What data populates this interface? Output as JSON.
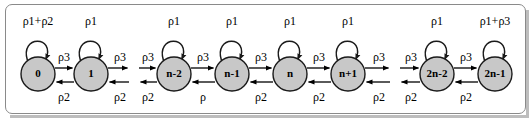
{
  "figure": {
    "width": 532,
    "height": 121,
    "background_color": "#ffffff",
    "frame_border_color": "#8a8a8a",
    "node_fill_color": "#c8c8c8",
    "node_stroke_color": "#1a1a1a",
    "arrow_color": "#000000"
  },
  "chart_data": {
    "type": "diagram",
    "diagram_kind": "markov-chain-state-transition",
    "node_radius": 17,
    "node_center_y": 74,
    "nodes": [
      {
        "id": "s0",
        "label": "0",
        "cx": 38,
        "cy": 74,
        "self_loop_rate": "ρ1+ρ2"
      },
      {
        "id": "s1",
        "label": "1",
        "cx": 91,
        "cy": 74,
        "self_loop_rate": "ρ1"
      },
      {
        "id": "sn-2",
        "label": "n-2",
        "cx": 174,
        "cy": 74,
        "self_loop_rate": "ρ1"
      },
      {
        "id": "sn-1",
        "label": "n-1",
        "cx": 232,
        "cy": 74,
        "self_loop_rate": "ρ1"
      },
      {
        "id": "sn",
        "label": "n",
        "cx": 290,
        "cy": 74,
        "self_loop_rate": "ρ1"
      },
      {
        "id": "sn+1",
        "label": "n+1",
        "cx": 348,
        "cy": 74,
        "self_loop_rate": "ρ1"
      },
      {
        "id": "s2n-2",
        "label": "2n-2",
        "cx": 437,
        "cy": 74,
        "self_loop_rate": "ρ1"
      },
      {
        "id": "s2n-1",
        "label": "2n-1",
        "cx": 495,
        "cy": 74,
        "self_loop_rate": "ρ1+ρ3"
      }
    ],
    "forward_transitions": [
      {
        "from": "s0",
        "to": "s1",
        "rate": "ρ3",
        "label_x": 64,
        "label_y": 58,
        "x1": 55,
        "x2": 74,
        "truncated": false
      },
      {
        "from": "s1",
        "to": "next",
        "rate": "ρ3",
        "label_x": 120,
        "label_y": 58,
        "x1": 108,
        "x2": 129,
        "truncated": true
      },
      {
        "from": "prev",
        "to": "sn-2",
        "rate": "ρ3",
        "label_x": 148,
        "label_y": 58,
        "x1": 139,
        "x2": 157,
        "truncated": true
      },
      {
        "from": "sn-2",
        "to": "sn-1",
        "rate": "ρ3",
        "label_x": 203,
        "label_y": 58,
        "x1": 191,
        "x2": 215,
        "truncated": false
      },
      {
        "from": "sn-1",
        "to": "sn",
        "rate": "ρ3",
        "label_x": 261,
        "label_y": 58,
        "x1": 249,
        "x2": 273,
        "truncated": false
      },
      {
        "from": "sn",
        "to": "sn+1",
        "rate": "ρ3",
        "label_x": 319,
        "label_y": 58,
        "x1": 307,
        "x2": 331,
        "truncated": false
      },
      {
        "from": "sn+1",
        "to": "next2",
        "rate": "ρ3",
        "label_x": 379,
        "label_y": 58,
        "x1": 365,
        "x2": 390,
        "truncated": true
      },
      {
        "from": "prev2",
        "to": "s2n-2",
        "rate": "ρ3",
        "label_x": 411,
        "label_y": 58,
        "x1": 400,
        "x2": 420,
        "truncated": true
      },
      {
        "from": "s2n-2",
        "to": "s2n-1",
        "rate": "ρ3",
        "label_x": 466,
        "label_y": 58,
        "x1": 454,
        "x2": 478,
        "truncated": false
      }
    ],
    "backward_transitions": [
      {
        "from": "s1",
        "to": "s0",
        "rate": "ρ2",
        "label_x": 64,
        "label_y": 98,
        "x1": 74,
        "x2": 55,
        "truncated": false
      },
      {
        "from": "next",
        "to": "s1",
        "rate": "ρ2",
        "label_x": 120,
        "label_y": 98,
        "x1": 129,
        "x2": 108,
        "truncated": true
      },
      {
        "from": "sn-2",
        "to": "prev",
        "rate": "ρ2",
        "label_x": 148,
        "label_y": 98,
        "x1": 157,
        "x2": 139,
        "truncated": true
      },
      {
        "from": "sn-1",
        "to": "sn-2",
        "rate": "ρ",
        "label_x": 203,
        "label_y": 98,
        "x1": 215,
        "x2": 191,
        "truncated": false
      },
      {
        "from": "sn",
        "to": "sn-1",
        "rate": "ρ2",
        "label_x": 261,
        "label_y": 98,
        "x1": 273,
        "x2": 249,
        "truncated": false
      },
      {
        "from": "sn+1",
        "to": "sn",
        "rate": "ρ2",
        "label_x": 319,
        "label_y": 98,
        "x1": 331,
        "x2": 307,
        "truncated": false
      },
      {
        "from": "next2",
        "to": "sn+1",
        "rate": "ρ2",
        "label_x": 379,
        "label_y": 98,
        "x1": 390,
        "x2": 365,
        "truncated": true
      },
      {
        "from": "s2n-2",
        "to": "prev2",
        "rate": "ρ2",
        "label_x": 411,
        "label_y": 98,
        "x1": 420,
        "x2": 400,
        "truncated": true
      },
      {
        "from": "s2n-1",
        "to": "s2n-2",
        "rate": "ρ2",
        "label_x": 466,
        "label_y": 98,
        "x1": 478,
        "x2": 454,
        "truncated": false
      }
    ],
    "self_loop_labels": [
      {
        "node": "s0",
        "text": "ρ1+ρ2",
        "x": 38,
        "y": 22
      },
      {
        "node": "s1",
        "text": "ρ1",
        "x": 91,
        "y": 22
      },
      {
        "node": "sn-2",
        "text": "ρ1",
        "x": 174,
        "y": 22
      },
      {
        "node": "sn-1",
        "text": "ρ1",
        "x": 232,
        "y": 22
      },
      {
        "node": "sn",
        "text": "ρ1",
        "x": 290,
        "y": 22
      },
      {
        "node": "sn+1",
        "text": "ρ1",
        "x": 348,
        "y": 22
      },
      {
        "node": "s2n-2",
        "text": "ρ1",
        "x": 437,
        "y": 22
      },
      {
        "node": "s2n-1",
        "text": "ρ1+ρ3",
        "x": 495,
        "y": 22
      }
    ],
    "rate_symbols": [
      "ρ",
      "ρ1",
      "ρ2",
      "ρ3",
      "ρ1+ρ2",
      "ρ1+ρ3"
    ]
  }
}
